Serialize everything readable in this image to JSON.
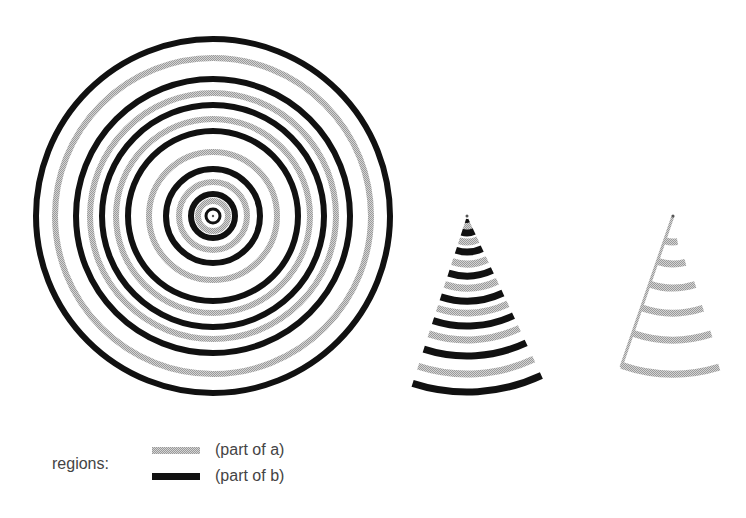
{
  "colors": {
    "region_a": "#b8b8b8",
    "region_b": "#111111",
    "text": "#444444"
  },
  "figure": {
    "full_circle": {
      "center": [
        213,
        216
      ],
      "black_ring_radii": [
        177,
        137,
        111,
        85,
        47,
        22,
        7
      ],
      "gray_ring_radii": [
        158,
        123,
        97,
        64,
        34,
        15
      ]
    },
    "wedge_both": {
      "apex": [
        467,
        216
      ],
      "angle_start_deg": 65,
      "angle_end_deg": 108,
      "black_ring_radii": [
        176,
        140,
        110,
        85,
        60,
        36,
        17,
        5
      ],
      "gray_ring_radii": [
        158,
        124,
        97,
        72,
        48,
        26,
        10
      ]
    },
    "wedge_a_only": {
      "apex": [
        673,
        216
      ],
      "edge_angle_deg": 109,
      "gray_arcs": [
        {
          "r": 26,
          "end_angle": 80
        },
        {
          "r": 48,
          "end_angle": 75
        },
        {
          "r": 72,
          "end_angle": 72
        },
        {
          "r": 97,
          "end_angle": 72
        },
        {
          "r": 124,
          "end_angle": 72
        },
        {
          "r": 158,
          "end_angle": 73
        }
      ]
    }
  },
  "legend": {
    "title": "regions:",
    "items": [
      {
        "label": "(part of a)",
        "swatch": "gray"
      },
      {
        "label": "(part of b)",
        "swatch": "black"
      }
    ]
  }
}
